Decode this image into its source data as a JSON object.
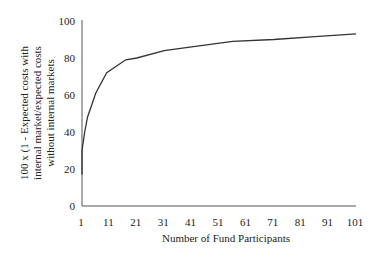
{
  "chart_data": {
    "type": "line",
    "title": "",
    "xlabel": "Number of Fund Participants",
    "ylabel_lines": [
      "100 x (1 - Expected costs with",
      "internal  market/expected costs",
      "without internal markets"
    ],
    "ylabel": "100 x (1 - Expected costs with internal market/expected costs without internal markets",
    "x_ticks": [
      "1",
      "11",
      "21",
      "31",
      "41",
      "51",
      "61",
      "71",
      "81",
      "91",
      "101"
    ],
    "y_ticks": [
      "0",
      "20",
      "40",
      "60",
      "80",
      "100"
    ],
    "xlim": [
      1,
      101
    ],
    "ylim": [
      0,
      100
    ],
    "grid": false,
    "legend": null,
    "series": [
      {
        "name": "cost reduction",
        "x": [
          1,
          1,
          2,
          3,
          6,
          10,
          17,
          21,
          31,
          41,
          56,
          71,
          86,
          101
        ],
        "values": [
          17,
          30,
          40,
          48,
          61,
          72,
          79,
          80,
          84,
          86,
          89,
          90,
          91.5,
          93
        ]
      }
    ],
    "colors": {
      "line": "#333333",
      "axis": "#555555"
    }
  }
}
